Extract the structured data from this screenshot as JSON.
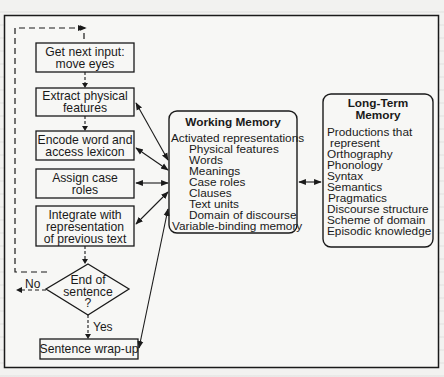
{
  "diagram": {
    "process_steps": [
      {
        "id": "step-1",
        "lines": [
          "Get next input:",
          "move eyes"
        ]
      },
      {
        "id": "step-2",
        "lines": [
          "Extract physical",
          "features"
        ]
      },
      {
        "id": "step-3",
        "lines": [
          "Encode word and",
          "access lexicon"
        ]
      },
      {
        "id": "step-4",
        "lines": [
          "Assign case",
          "roles"
        ]
      },
      {
        "id": "step-5",
        "lines": [
          "Integrate with",
          "representation",
          "of previous text"
        ]
      },
      {
        "id": "step-7",
        "lines": [
          "Sentence wrap-up"
        ]
      }
    ],
    "decision": {
      "lines": [
        "End of",
        "sentence",
        "?"
      ],
      "yes_label": "Yes",
      "no_label": "No"
    },
    "working_memory": {
      "title": "Working Memory",
      "items": [
        {
          "text": "Activated representations",
          "indent": 0
        },
        {
          "text": "Physical features",
          "indent": 1
        },
        {
          "text": "Words",
          "indent": 1
        },
        {
          "text": "Meanings",
          "indent": 1
        },
        {
          "text": "Case roles",
          "indent": 1
        },
        {
          "text": "Clauses",
          "indent": 1
        },
        {
          "text": "Text units",
          "indent": 1
        },
        {
          "text": "Domain of discourse",
          "indent": 1
        },
        {
          "text": "Variable-binding memory",
          "indent": 0
        }
      ]
    },
    "long_term_memory": {
      "title_lines": [
        "Long-Term",
        "Memory"
      ],
      "items": [
        {
          "text": "Productions that",
          "indent": 0
        },
        {
          "text": "represent",
          "indent": 1
        },
        {
          "text": "Orthography",
          "indent": 0
        },
        {
          "text": "Phonology",
          "indent": 0
        },
        {
          "text": "Syntax",
          "indent": 0
        },
        {
          "text": "Semantics",
          "indent": 0
        },
        {
          "text": "Pragmatics",
          "indent": 0
        },
        {
          "text": "Discourse structure",
          "indent": 0
        },
        {
          "text": "Scheme of domain",
          "indent": 0
        },
        {
          "text": "Episodic knowledge",
          "indent": 0
        }
      ]
    },
    "colors": {
      "ink": "#1a1a1a",
      "paper": "#f2f2f0"
    }
  }
}
